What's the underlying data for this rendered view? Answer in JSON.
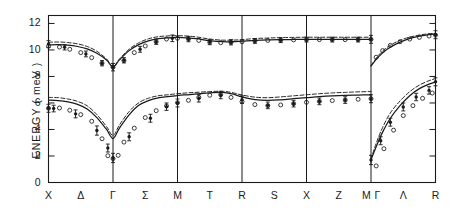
{
  "figure": {
    "axis_title_y": "ENERGY  ( meV )",
    "background": "#ffffff",
    "line_color": "#1a1a1a"
  },
  "chart_data": {
    "type": "line",
    "title": "",
    "xlabel": "",
    "ylabel": "ENERGY  ( meV )",
    "ylim": [
      0,
      12.6
    ],
    "yticks": [
      0,
      2,
      4,
      6,
      8,
      10,
      12
    ],
    "ytick_labels": [
      "0",
      "2",
      "4",
      "6",
      "8",
      "10",
      "12"
    ],
    "grid": false,
    "legend": "none",
    "high_symmetry_points": [
      "X",
      "Γ",
      "M",
      "R",
      "X",
      "MΓ",
      "R"
    ],
    "segment_labels": [
      "Δ",
      "Σ",
      "T",
      "S",
      "Z",
      "Λ"
    ],
    "xtick_labels": [
      "X",
      "Δ",
      "Γ",
      "Σ",
      "M",
      "T",
      "R",
      "S",
      "X",
      "Z",
      "M",
      "Γ",
      "Λ",
      "R"
    ],
    "panel_boundaries_mev": [
      0,
      1,
      2,
      3,
      4,
      5,
      6
    ],
    "series": [
      {
        "name": "upper-branch-solid",
        "style": "solid",
        "x": [
          0.0,
          0.15,
          0.3,
          0.45,
          0.6,
          0.75,
          0.9,
          1.0,
          1.1,
          1.25,
          1.4,
          1.55,
          1.7,
          1.85,
          2.0,
          2.15,
          2.3,
          2.5,
          2.7,
          2.85,
          3.0,
          3.2,
          3.4,
          3.6,
          3.8,
          4.0,
          4.2,
          4.4,
          4.6,
          4.8,
          5.0
        ],
        "values": [
          10.38,
          10.4,
          10.36,
          10.26,
          10.08,
          9.75,
          9.25,
          8.72,
          9.25,
          9.95,
          10.4,
          10.68,
          10.85,
          10.92,
          10.95,
          10.92,
          10.85,
          10.7,
          10.62,
          10.62,
          10.66,
          10.72,
          10.76,
          10.78,
          10.79,
          10.8,
          10.8,
          10.8,
          10.8,
          10.8,
          10.8
        ]
      },
      {
        "name": "upper-branch-dashed",
        "style": "dashed",
        "x": [
          0.0,
          0.15,
          0.3,
          0.45,
          0.6,
          0.75,
          0.9,
          1.0,
          1.1,
          1.25,
          1.4,
          1.55,
          1.7,
          1.85,
          2.0,
          2.15,
          2.3,
          2.5,
          2.7,
          2.85,
          3.0,
          3.2,
          3.4,
          3.6,
          3.8,
          4.0,
          4.2,
          4.4,
          4.6,
          4.8,
          5.0
        ],
        "values": [
          10.58,
          10.6,
          10.56,
          10.46,
          10.26,
          9.9,
          9.32,
          8.74,
          9.32,
          10.06,
          10.54,
          10.84,
          11.0,
          11.06,
          11.08,
          11.05,
          10.98,
          10.82,
          10.74,
          10.74,
          10.78,
          10.86,
          10.9,
          10.93,
          10.95,
          10.96,
          10.96,
          10.96,
          10.96,
          10.96,
          10.96
        ]
      },
      {
        "name": "upper-branch-solid-right",
        "style": "solid",
        "x": [
          5.0,
          5.12,
          5.25,
          5.4,
          5.55,
          5.7,
          5.85,
          6.0
        ],
        "values": [
          8.8,
          9.5,
          10.05,
          10.48,
          10.78,
          10.98,
          11.12,
          11.2
        ]
      },
      {
        "name": "upper-branch-dashed-right",
        "style": "dashed",
        "x": [
          5.0,
          5.12,
          5.25,
          5.4,
          5.55,
          5.7,
          5.85,
          6.0
        ],
        "values": [
          8.82,
          9.62,
          10.2,
          10.62,
          10.9,
          11.08,
          11.2,
          11.26
        ]
      },
      {
        "name": "lower-branch-solid",
        "style": "solid",
        "x": [
          0.0,
          0.15,
          0.3,
          0.45,
          0.6,
          0.75,
          0.9,
          1.0,
          1.1,
          1.25,
          1.4,
          1.55,
          1.7,
          1.85,
          2.0,
          2.15,
          2.3,
          2.5,
          2.7,
          2.85,
          3.0,
          3.2,
          3.4,
          3.6,
          3.8,
          4.0,
          4.2,
          4.4,
          4.6,
          4.8,
          5.0
        ],
        "values": [
          6.22,
          6.18,
          6.08,
          5.9,
          5.55,
          4.9,
          4.0,
          3.32,
          4.1,
          5.1,
          5.82,
          6.18,
          6.38,
          6.48,
          6.56,
          6.62,
          6.68,
          6.76,
          6.8,
          6.68,
          6.46,
          6.26,
          6.2,
          6.24,
          6.32,
          6.4,
          6.48,
          6.54,
          6.58,
          6.6,
          6.62
        ]
      },
      {
        "name": "lower-branch-dashed",
        "style": "dashed",
        "x": [
          0.0,
          0.15,
          0.3,
          0.45,
          0.6,
          0.75,
          0.9,
          1.0,
          1.1,
          1.25,
          1.4,
          1.55,
          1.7,
          1.85,
          2.0,
          2.15,
          2.3,
          2.5,
          2.7,
          2.85,
          3.0,
          3.2,
          3.4,
          3.6,
          3.8,
          4.0,
          4.2,
          4.4,
          4.6,
          4.8,
          5.0
        ],
        "values": [
          6.42,
          6.4,
          6.3,
          6.12,
          5.78,
          5.12,
          4.22,
          3.55,
          4.34,
          5.35,
          6.02,
          6.36,
          6.54,
          6.62,
          6.7,
          6.76,
          6.8,
          6.86,
          6.88,
          6.78,
          6.6,
          6.44,
          6.4,
          6.46,
          6.54,
          6.62,
          6.7,
          6.76,
          6.8,
          6.84,
          6.86
        ]
      },
      {
        "name": "lower-branch-solid-right",
        "style": "solid",
        "x": [
          5.0,
          5.08,
          5.18,
          5.3,
          5.45,
          5.6,
          5.75,
          5.9,
          6.0
        ],
        "values": [
          1.72,
          2.7,
          3.8,
          4.85,
          5.8,
          6.55,
          7.08,
          7.42,
          7.58
        ]
      },
      {
        "name": "lower-branch-dashed-right",
        "style": "dashed",
        "x": [
          5.0,
          5.08,
          5.18,
          5.3,
          5.45,
          5.6,
          5.75,
          5.9,
          6.0
        ],
        "values": [
          1.74,
          2.95,
          4.15,
          5.25,
          6.15,
          6.85,
          7.35,
          7.68,
          7.84
        ]
      }
    ],
    "data_points": [
      {
        "name": "open-circles",
        "marker": "open-circle",
        "x": [
          0.0,
          0.17,
          0.33,
          0.5,
          0.67,
          0.83,
          1.0,
          1.17,
          1.33,
          1.5,
          1.67,
          1.83,
          2.0,
          2.17,
          2.33,
          2.5,
          2.67,
          2.83,
          3.0,
          3.2,
          3.4,
          3.6,
          3.8,
          4.0,
          4.2,
          4.4,
          4.6,
          4.8,
          5.0,
          0.0,
          0.17,
          0.33,
          0.5,
          0.67,
          0.83,
          0.92,
          1.0,
          1.08,
          1.17,
          1.33,
          1.5,
          1.67,
          1.83,
          2.0,
          2.17,
          2.33,
          2.5,
          2.67,
          2.83,
          3.0,
          3.2,
          3.4,
          3.6,
          3.8,
          4.0,
          4.2,
          4.4,
          4.6,
          4.8,
          5.0,
          5.08,
          5.18,
          5.3,
          5.45,
          5.6,
          5.75,
          5.9,
          6.0,
          5.08,
          5.2,
          5.35,
          5.5,
          5.65,
          5.8,
          5.95
        ],
        "values": [
          10.28,
          10.22,
          10.05,
          9.8,
          9.42,
          9.0,
          8.7,
          9.2,
          9.8,
          10.3,
          10.62,
          10.82,
          10.88,
          10.82,
          10.72,
          10.58,
          10.55,
          10.58,
          10.62,
          10.68,
          10.72,
          10.74,
          10.76,
          10.78,
          10.78,
          10.78,
          10.78,
          10.78,
          10.8,
          5.6,
          5.62,
          5.45,
          5.12,
          4.62,
          3.3,
          2.02,
          1.8,
          2.05,
          3.05,
          4.1,
          4.9,
          5.42,
          5.78,
          6.02,
          6.2,
          6.42,
          6.58,
          6.62,
          6.42,
          6.1,
          5.88,
          5.8,
          5.85,
          5.95,
          6.05,
          6.12,
          6.18,
          6.22,
          6.28,
          6.32,
          9.45,
          9.95,
          10.35,
          10.62,
          10.82,
          10.95,
          11.05,
          11.12,
          1.25,
          2.55,
          3.95,
          5.05,
          5.8,
          6.35,
          6.75
        ]
      },
      {
        "name": "error-bar-points",
        "marker": "point-with-error-bar",
        "x": [
          0.0,
          0.25,
          0.58,
          0.83,
          1.0,
          1.17,
          1.42,
          1.67,
          1.92,
          2.17,
          2.5,
          2.83,
          3.2,
          3.6,
          4.0,
          4.4,
          4.8,
          5.0,
          0.0,
          0.08,
          0.42,
          0.75,
          0.92,
          1.0,
          1.25,
          1.58,
          1.83,
          2.0,
          2.33,
          2.67,
          3.0,
          3.4,
          3.8,
          4.2,
          4.6,
          5.0,
          5.0,
          5.15,
          5.3,
          5.5,
          5.7,
          5.9,
          6.0,
          6.0
        ],
        "values": [
          10.45,
          10.2,
          9.7,
          9.0,
          8.7,
          9.22,
          10.05,
          10.62,
          10.88,
          10.82,
          10.6,
          10.58,
          10.68,
          10.74,
          10.78,
          10.78,
          10.78,
          10.8,
          5.6,
          5.58,
          5.18,
          3.92,
          2.6,
          1.85,
          3.45,
          4.85,
          5.72,
          6.0,
          6.35,
          6.6,
          6.25,
          5.82,
          5.95,
          6.12,
          6.22,
          6.32,
          1.7,
          3.15,
          4.55,
          5.7,
          6.45,
          6.95,
          7.6,
          11.15
        ],
        "errors": [
          0.25,
          0.2,
          0.22,
          0.2,
          0.28,
          0.2,
          0.22,
          0.2,
          0.25,
          0.2,
          0.2,
          0.2,
          0.18,
          0.18,
          0.18,
          0.18,
          0.18,
          0.3,
          0.3,
          0.25,
          0.3,
          0.35,
          0.3,
          0.35,
          0.3,
          0.3,
          0.28,
          0.3,
          0.28,
          0.28,
          0.28,
          0.25,
          0.25,
          0.25,
          0.25,
          0.3,
          0.35,
          0.3,
          0.3,
          0.3,
          0.28,
          0.28,
          0.3,
          0.3
        ]
      }
    ]
  }
}
